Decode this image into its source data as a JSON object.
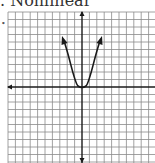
{
  "figure": {
    "label": ". Nonlinear",
    "bullet": "•"
  },
  "graph": {
    "grid_color": "#8a8a8a",
    "axis_color": "#1a1a1a",
    "curve_color": "#1a1a1a",
    "curve": "parabola",
    "vertex": [
      0,
      0
    ],
    "arrows": "both-ends-up"
  }
}
